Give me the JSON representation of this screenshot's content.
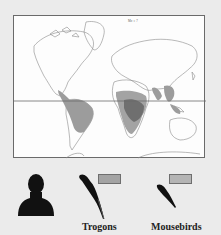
{
  "figure": {
    "map_stamp": "Mo ≡ 7",
    "colors": {
      "background": "#ebebeb",
      "map_bg": "#fdfdfd",
      "coastline": "#7a7a7a",
      "trogon_range": "#9c9c9c",
      "mousebird_range": "#a8a8a8",
      "overlap_range": "#6f6f6f",
      "legend_trogon": "#a3a3a3",
      "legend_mousebird": "#b4b4b4",
      "silhouette": "#111111"
    }
  },
  "legend": {
    "items": [
      {
        "label": "Trogons",
        "icon": "trogon-silhouette-icon",
        "swatch": "#a3a3a3"
      },
      {
        "label": "Mousebirds",
        "icon": "mousebird-silhouette-icon",
        "swatch": "#b4b4b4"
      }
    ],
    "human_icon": "person-silhouette-icon"
  }
}
